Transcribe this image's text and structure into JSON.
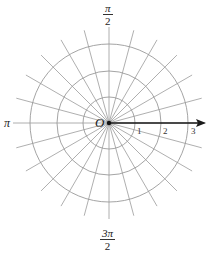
{
  "diagram": {
    "type": "polar-coordinate-grid",
    "center": {
      "x": 109,
      "y": 123
    },
    "circles": [
      {
        "r_value": 1,
        "radius_px": 26
      },
      {
        "r_value": 2,
        "radius_px": 52
      },
      {
        "r_value": 3,
        "radius_px": 79
      }
    ],
    "radial_lines": {
      "count": 24,
      "step_degrees": 15,
      "length_px": 96
    },
    "polar_axis": {
      "direction": "right",
      "arrow": true
    },
    "origin_label": "O",
    "angle_labels": {
      "top": {
        "num": "π",
        "den": "2"
      },
      "left": "π",
      "bottom": {
        "num": "3π",
        "den": "2"
      }
    },
    "axis_ticks": [
      "1",
      "2",
      "3"
    ],
    "colors": {
      "grid": "#9a9a9a",
      "axis": "#1a1a1a",
      "text": "#222222"
    }
  }
}
